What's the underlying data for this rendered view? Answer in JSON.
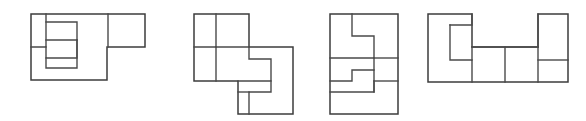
{
  "document": {
    "title": "Rectangle dissection puzzle figures",
    "background_color": "#ffffff",
    "stroke_color": "#3d3d3d",
    "figure_count": 4,
    "caption": ""
  },
  "figures": [
    {
      "id": "figure-1",
      "name": "L-shaped region with interlocking pieces",
      "label": "",
      "bbox": {
        "x": 31,
        "y": 14,
        "width": 114,
        "height": 66
      },
      "outline": "M31,14 L145,14 L145,47 L107,47 L107,80 L31,80 Z",
      "interior_lines": [
        "M108,14 L108,47",
        "M46,14 L46,47 L31,47",
        "M46,22 L77,22 L77,40 L46,40",
        "M46,47 L46,58 L77,58 L77,40",
        "M77,40 L77,68 L46,68 L46,58"
      ],
      "piece_count": 4
    },
    {
      "id": "figure-2",
      "name": "Pinwheel dissection of four L pieces",
      "label": "",
      "bbox": {
        "x": 194,
        "y": 14,
        "width": 99,
        "height": 100
      },
      "outline": "M194,14 L249,14 L249,47 L293,47 L293,114 L238,114 L238,81 L194,81 Z",
      "interior_lines": [
        "M216,14 L216,47 L194,47",
        "M216,47 L249,47",
        "M216,47 L216,81",
        "M249,47 L249,59 L271,59 L271,81 L238,81",
        "M271,81 L271,92 L249,92 L249,114",
        "M249,92 L238,92"
      ],
      "piece_count": 4
    },
    {
      "id": "figure-3",
      "name": "Vertical rectangle with interlocking pieces",
      "label": "",
      "bbox": {
        "x": 330,
        "y": 14,
        "width": 68,
        "height": 100
      },
      "outline": "M330,14 L398,14 L398,114 L330,114 Z",
      "interior_lines": [
        "M352,14 L352,36 L374,36 L374,58 L330,58",
        "M330,81 L352,81 L352,70 L374,70 L374,92 L330,92",
        "M374,70 L374,58",
        "M374,58 L398,58",
        "M374,81 L398,81",
        "M374,81 L374,92"
      ],
      "piece_count": 4
    },
    {
      "id": "figure-4",
      "name": "Wide rectangle with interlocking L pieces",
      "label": "",
      "bbox": {
        "x": 428,
        "y": 14,
        "width": 140,
        "height": 68
      },
      "outline": "M428,14 L472,14 L472,47 L538,47 L538,14 L568,14 L568,82 L428,82 Z",
      "interior_lines": [
        "M450,25 L472,25 L472,14",
        "M450,25 L450,60 L472,60 L472,82",
        "M472,47 L538,47",
        "M472,47 L472,60",
        "M538,14 L538,47",
        "M538,60 L568,60",
        "M538,47 L538,82",
        "M505,47 L505,82"
      ],
      "piece_count": 5
    }
  ]
}
